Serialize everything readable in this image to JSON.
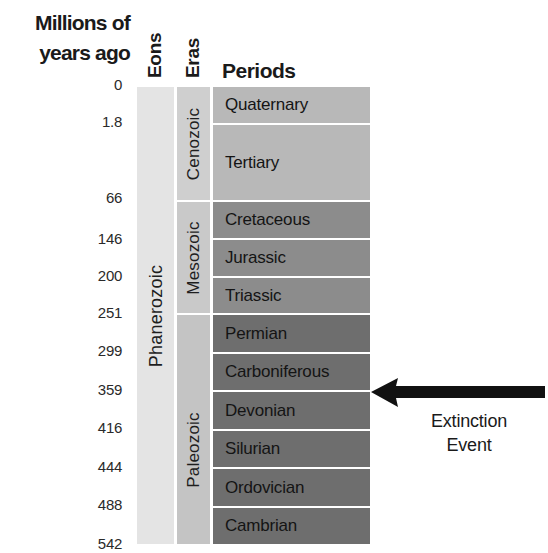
{
  "header": {
    "time_axis_title_line1": "Millions of",
    "time_axis_title_line2": "years ago",
    "eons_label": "Eons",
    "eras_label": "Eras",
    "periods_label": "Periods"
  },
  "ticks": [
    "0",
    "1.8",
    "66",
    "146",
    "200",
    "251",
    "299",
    "359",
    "416",
    "444",
    "488",
    "542"
  ],
  "eons": [
    {
      "name": "Phanerozoic",
      "color": "#e4e4e4"
    }
  ],
  "eras": [
    {
      "name": "Cenozoic",
      "color": "#cfcfcf"
    },
    {
      "name": "Mesozoic",
      "color": "#c9c9c9"
    },
    {
      "name": "Paleozoic",
      "color": "#c4c4c4"
    }
  ],
  "periods": [
    {
      "name": "Quaternary",
      "color": "#b8b8b8"
    },
    {
      "name": "Tertiary",
      "color": "#b8b8b8"
    },
    {
      "name": "Cretaceous",
      "color": "#8c8c8c"
    },
    {
      "name": "Jurassic",
      "color": "#8c8c8c"
    },
    {
      "name": "Triassic",
      "color": "#8c8c8c"
    },
    {
      "name": "Permian",
      "color": "#6e6e6e"
    },
    {
      "name": "Carboniferous",
      "color": "#6e6e6e"
    },
    {
      "name": "Devonian",
      "color": "#6e6e6e"
    },
    {
      "name": "Silurian",
      "color": "#6e6e6e"
    },
    {
      "name": "Ordovician",
      "color": "#6e6e6e"
    },
    {
      "name": "Cambrian",
      "color": "#6e6e6e"
    }
  ],
  "annotation": {
    "line1": "Extinction",
    "line2": "Event",
    "points_to_boundary_between": [
      "Carboniferous",
      "Devonian"
    ],
    "arrow_color": "#111111"
  }
}
